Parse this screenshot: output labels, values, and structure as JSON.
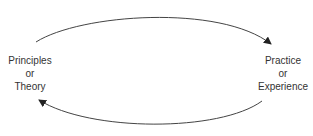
{
  "nodes": {
    "left": {
      "line1": "Principles",
      "line2": "or",
      "line3": "Theory"
    },
    "right": {
      "line1": "Practice",
      "line2": "or",
      "line3": "Experience"
    }
  },
  "edges": [
    {
      "from": "left",
      "to": "right",
      "position": "top"
    },
    {
      "from": "right",
      "to": "left",
      "position": "bottom"
    }
  ],
  "colors": {
    "stroke": "#444444",
    "text": "#333333"
  }
}
